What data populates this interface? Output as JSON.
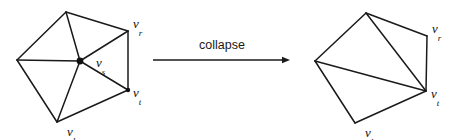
{
  "figure": {
    "background_color": "#ffffff",
    "stroke_color": "#1a1a1a",
    "width": 454,
    "height": 140
  },
  "transition": {
    "label": "collapse",
    "arrow": {
      "x1": 153,
      "y1": 60,
      "x2": 290,
      "y2": 60,
      "direction": "right"
    },
    "label_position": {
      "x": 222,
      "y": 49
    }
  },
  "before": {
    "name": "mesh-before-collapse",
    "vertices": [
      {
        "id": "top",
        "x": 66,
        "y": 12,
        "label": null,
        "marked": false
      },
      {
        "id": "vr",
        "x": 128,
        "y": 31,
        "label": "v",
        "subscript": "r",
        "marked": false,
        "label_x": 133,
        "label_y": 28
      },
      {
        "id": "vt",
        "x": 128,
        "y": 90,
        "label": "v",
        "subscript": "t",
        "marked": true,
        "label_x": 133,
        "label_y": 97
      },
      {
        "id": "vl",
        "x": 57,
        "y": 122,
        "label": "v",
        "subscript": "l",
        "marked": false,
        "label_x": 67,
        "label_y": 136
      },
      {
        "id": "left",
        "x": 17,
        "y": 60,
        "label": null,
        "marked": false
      },
      {
        "id": "vs",
        "x": 80,
        "y": 61,
        "label": "v",
        "subscript": "s",
        "marked": true,
        "label_x": 96,
        "label_y": 67
      }
    ],
    "boundary_edges": [
      [
        "left",
        "top"
      ],
      [
        "top",
        "vr"
      ],
      [
        "vr",
        "vt"
      ],
      [
        "vt",
        "vl"
      ],
      [
        "vl",
        "left"
      ]
    ],
    "interior_edges": [
      [
        "vs",
        "top"
      ],
      [
        "vs",
        "vr"
      ],
      [
        "vs",
        "vt"
      ],
      [
        "vs",
        "vl"
      ],
      [
        "vs",
        "left"
      ]
    ]
  },
  "after": {
    "name": "mesh-after-collapse",
    "vertices": [
      {
        "id": "top",
        "x": 366,
        "y": 13,
        "label": null,
        "marked": false
      },
      {
        "id": "vr",
        "x": 427,
        "y": 36,
        "label": "v",
        "subscript": "r",
        "marked": false,
        "label_x": 432,
        "label_y": 33
      },
      {
        "id": "vt",
        "x": 426,
        "y": 91,
        "label": "v",
        "subscript": "t",
        "marked": false,
        "label_x": 431,
        "label_y": 98
      },
      {
        "id": "vl",
        "x": 355,
        "y": 123,
        "label": "v",
        "subscript": "l",
        "marked": false,
        "label_x": 365,
        "label_y": 137
      },
      {
        "id": "left",
        "x": 315,
        "y": 61,
        "label": null,
        "marked": false
      }
    ],
    "boundary_edges": [
      [
        "left",
        "top"
      ],
      [
        "top",
        "vr"
      ],
      [
        "vr",
        "vt"
      ],
      [
        "vt",
        "vl"
      ],
      [
        "vl",
        "left"
      ]
    ],
    "interior_edges": [
      [
        "vt",
        "top"
      ],
      [
        "vt",
        "left"
      ]
    ]
  }
}
